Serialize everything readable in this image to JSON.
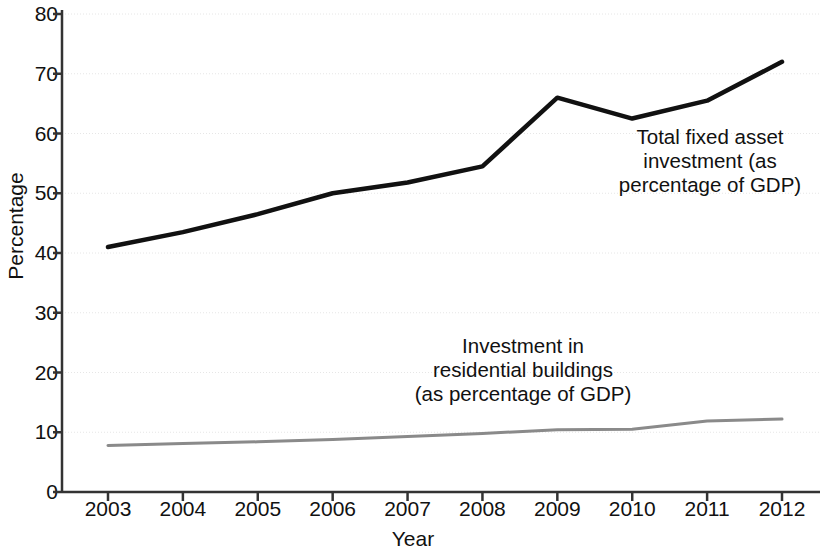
{
  "chart_data": {
    "type": "line",
    "title": "",
    "xlabel": "Year",
    "ylabel": "Percentage",
    "x": [
      2003,
      2004,
      2005,
      2006,
      2007,
      2008,
      2009,
      2010,
      2011,
      2012
    ],
    "xticklabels": [
      "2003",
      "2004",
      "2005",
      "2006",
      "2007",
      "2008",
      "2009",
      "2010",
      "2011",
      "2012"
    ],
    "yticklabels": [
      "0",
      "10",
      "20",
      "30",
      "40",
      "50",
      "60",
      "70",
      "80"
    ],
    "yticks": [
      0,
      10,
      20,
      30,
      40,
      50,
      60,
      70,
      80
    ],
    "ylim": [
      0,
      80
    ],
    "xlim": [
      2003,
      2012
    ],
    "grid": true,
    "legend": "annotations",
    "series": [
      {
        "name": "Total fixed asset investment (as percentage of GDP)",
        "color": "#111111",
        "width": 4.5,
        "values": [
          41,
          43.5,
          46.5,
          50,
          51.8,
          54.5,
          66,
          62.5,
          65.5,
          72
        ]
      },
      {
        "name": "Investment in residential buildings (as percentage of GDP)",
        "color": "#8a8a8a",
        "width": 3,
        "values": [
          7.8,
          8.1,
          8.4,
          8.8,
          9.3,
          9.8,
          10.4,
          10.5,
          11.9,
          12.2
        ]
      }
    ],
    "annotations": [
      {
        "id": "total",
        "text": "Total fixed asset\ninvestment (as\npercentage of GDP)"
      },
      {
        "id": "residential",
        "text": "Investment in\nresidential buildings\n(as percentage of GDP)"
      }
    ]
  },
  "axis": {
    "ylabel": "Percentage",
    "xlabel": "Year",
    "color": "#333333",
    "gridcolor": "#e6e6e6"
  }
}
